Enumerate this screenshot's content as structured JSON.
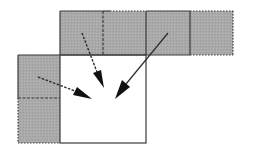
{
  "diagram": {
    "colors": {
      "background": "#ffffff",
      "cell_fill": "#a9a9a9",
      "stroke": "#3a3a3a",
      "arrow": "#1a1a1a"
    },
    "central_square": {
      "x": 60,
      "y": 55,
      "w": 86,
      "h": 88,
      "fill": "#ffffff"
    },
    "shaded_cells": [
      {
        "id": "top-1",
        "x": 60,
        "y": 11,
        "w": 43,
        "h": 44
      },
      {
        "id": "top-2",
        "x": 103,
        "y": 11,
        "w": 43,
        "h": 44
      },
      {
        "id": "top-3",
        "x": 146,
        "y": 11,
        "w": 44,
        "h": 44
      },
      {
        "id": "top-4",
        "x": 190,
        "y": 11,
        "w": 43,
        "h": 44
      },
      {
        "id": "left-1",
        "x": 18,
        "y": 55,
        "w": 42,
        "h": 43
      },
      {
        "id": "left-2",
        "x": 18,
        "y": 98,
        "w": 42,
        "h": 45
      }
    ],
    "arrows": [
      {
        "id": "dashed-arrow-top",
        "style": "dashed",
        "from": [
          82,
          33
        ],
        "to": [
          104,
          88
        ]
      },
      {
        "id": "solid-arrow",
        "style": "solid",
        "from": [
          168,
          33
        ],
        "to": [
          115,
          99
        ]
      },
      {
        "id": "dashed-arrow-left",
        "style": "dashed",
        "from": [
          38,
          77
        ],
        "to": [
          92,
          99
        ]
      }
    ]
  }
}
